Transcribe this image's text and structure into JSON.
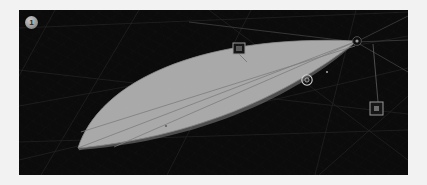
{
  "viewport": {
    "badge_label": "1",
    "background_color": "#0b0b0b",
    "frame_color": "#f2f2f2",
    "grid_line_color": "#3a3a3a",
    "width": 389,
    "height": 165
  },
  "shape": {
    "name": "lens-surface",
    "fill_color": "#a9a9a9",
    "edge_color": "#6e6e6e",
    "isoline_color": "#7a7a7a"
  },
  "handles": {
    "top_square": {
      "label": "",
      "x": 220,
      "y": 40,
      "color": "#9a9a9a"
    },
    "right_square": {
      "label": "",
      "x": 360,
      "y": 99,
      "color": "#9a9a9a"
    },
    "center_circle": {
      "label": "",
      "x": 288,
      "y": 70,
      "color": "#c8c8c8"
    },
    "corner_vertex": {
      "label": "",
      "x": 356,
      "y": 42,
      "color": "#111111"
    }
  },
  "grid": {
    "lines": [
      {
        "x1": 0,
        "y1": 18,
        "x2": 389,
        "y2": 2
      },
      {
        "x1": 0,
        "y1": 96,
        "x2": 389,
        "y2": 26
      },
      {
        "x1": 0,
        "y1": 150,
        "x2": 389,
        "y2": 58
      },
      {
        "x1": 36,
        "y1": 0,
        "x2": 0,
        "y2": 66
      },
      {
        "x1": 120,
        "y1": 0,
        "x2": 22,
        "y2": 165
      },
      {
        "x1": 232,
        "y1": 0,
        "x2": 148,
        "y2": 165
      },
      {
        "x1": 337,
        "y1": 0,
        "x2": 296,
        "y2": 165
      },
      {
        "x1": 389,
        "y1": 86,
        "x2": 300,
        "y2": 165
      },
      {
        "x1": 0,
        "y1": 132,
        "x2": 389,
        "y2": 120
      }
    ]
  }
}
